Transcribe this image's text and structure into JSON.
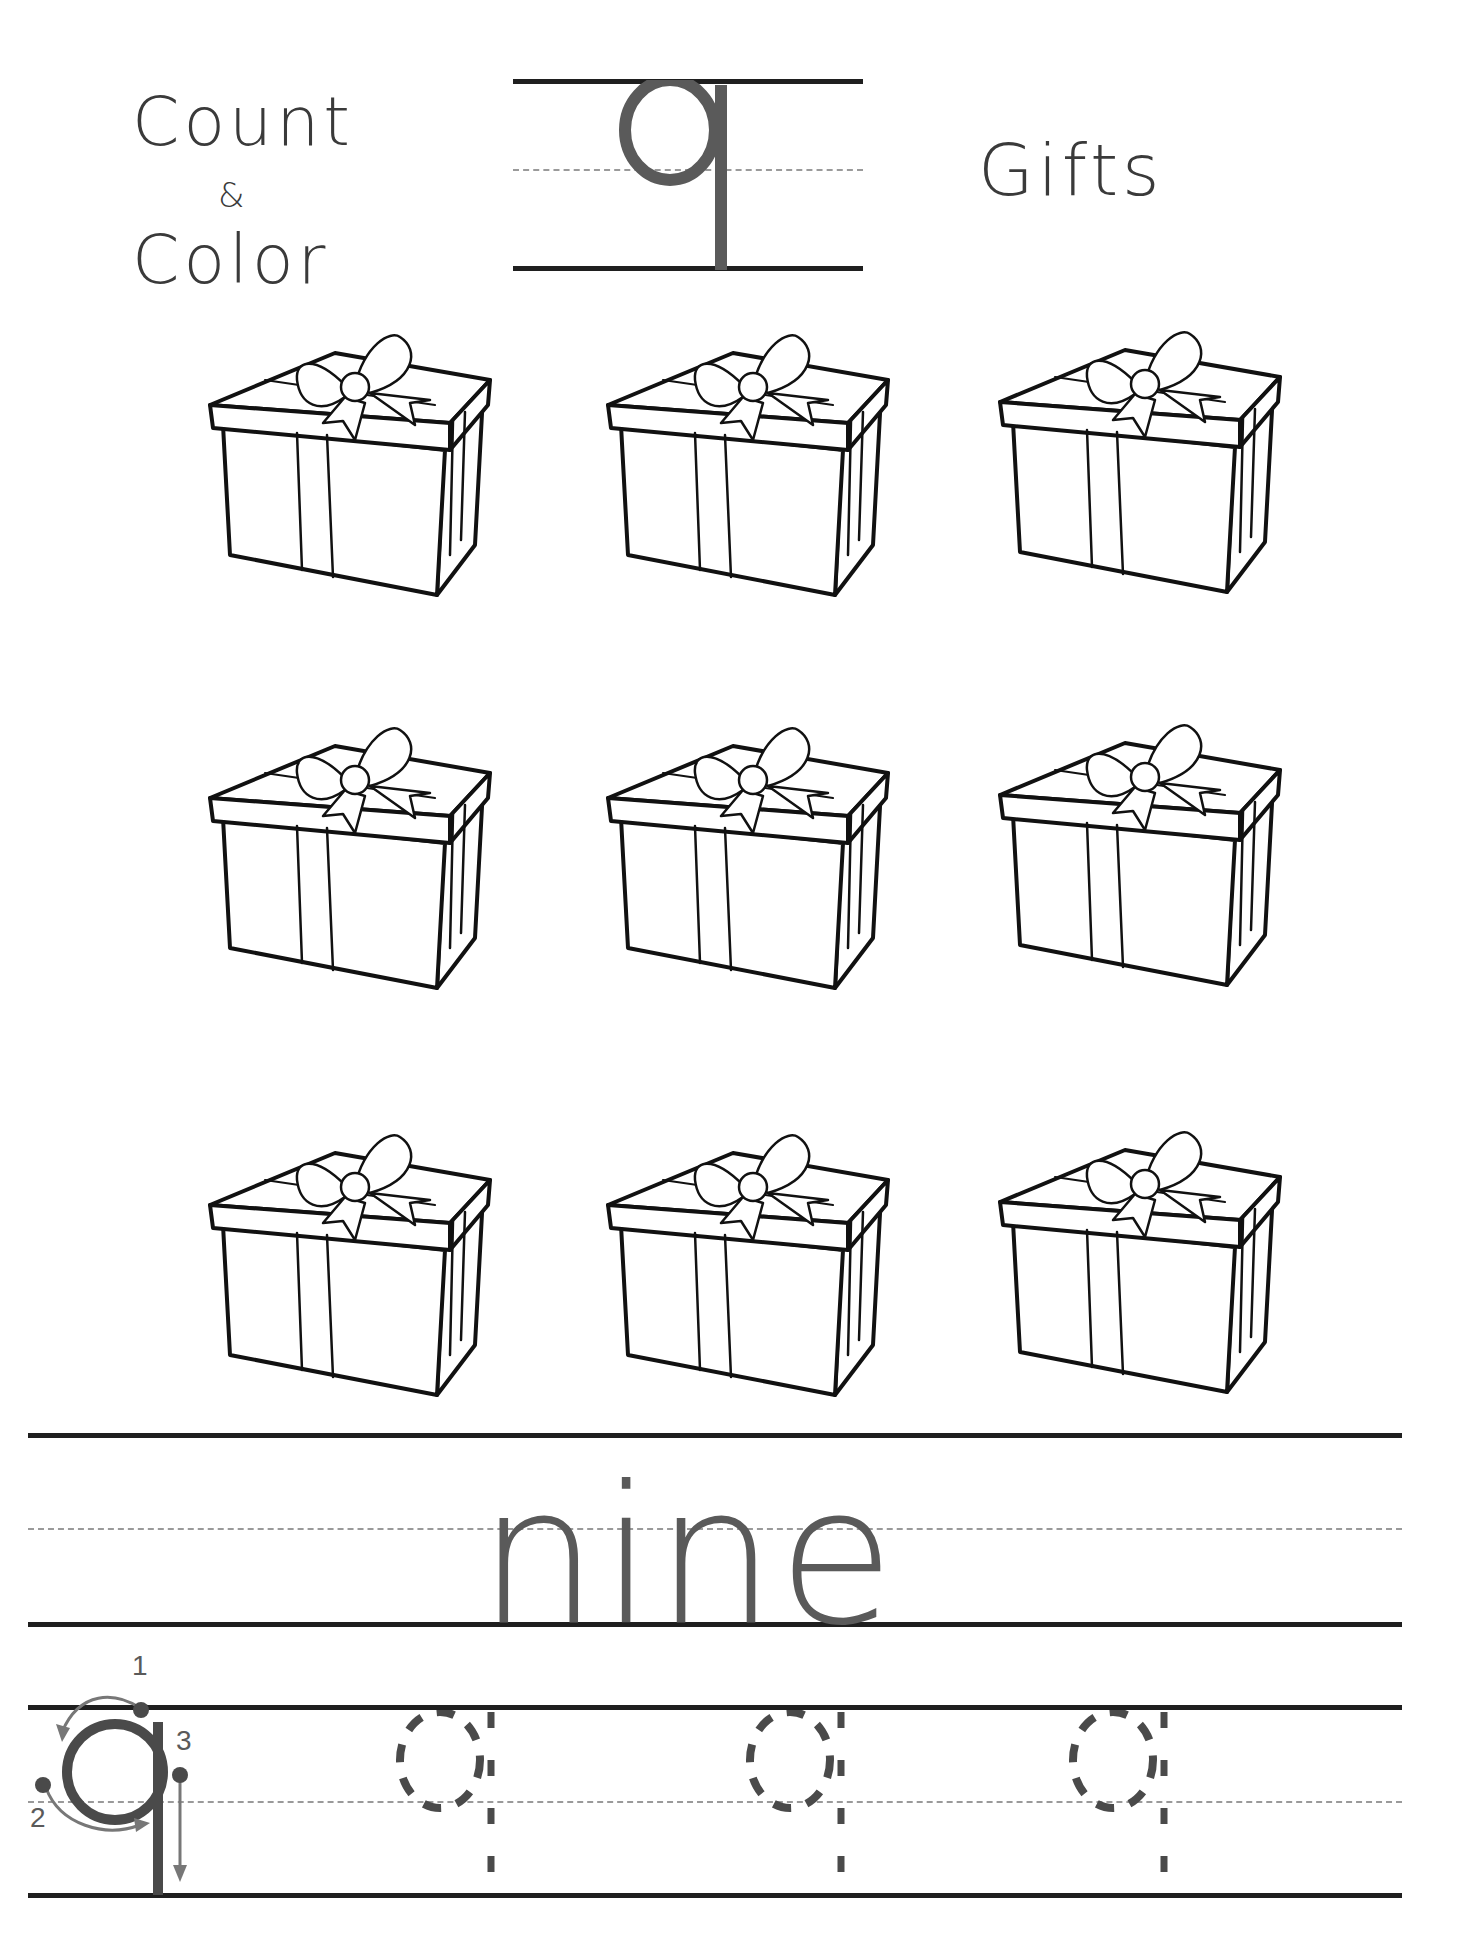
{
  "header": {
    "title_line1": "Count",
    "title_amp": "&",
    "title_line2": "Color",
    "letter": "q",
    "subject": "Gifts"
  },
  "grid": {
    "rows": 3,
    "columns": 3,
    "item": "gift box with bow",
    "count": 9
  },
  "word": "nine",
  "letter_formation": {
    "letter": "q",
    "steps": [
      "1",
      "2",
      "3"
    ],
    "trace_count": 3
  },
  "colors": {
    "line": "#1f1f1f",
    "letter_gray": "#5a5a5a",
    "guide_dash": "#9a9a9a",
    "trace_dash": "#4a4a4a"
  }
}
